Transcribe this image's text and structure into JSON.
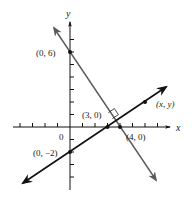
{
  "diagram": {
    "type": "coordinate-geometry",
    "axes": {
      "x_label": "x",
      "y_label": "y",
      "origin_label": "0",
      "unit_px": 12.5,
      "origin_px": [
        70,
        127
      ]
    },
    "lines": [
      {
        "name": "line-through-0-6-and-4-0",
        "color": "#5a5a5a",
        "points": [
          [
            0,
            6
          ],
          [
            4,
            0
          ]
        ],
        "slope": -1.5
      },
      {
        "name": "line-through-0-neg2-and-3-0",
        "color": "#111111",
        "points": [
          [
            0,
            -2
          ],
          [
            3,
            0
          ]
        ],
        "slope": 0.6667
      }
    ],
    "points": [
      {
        "label": "(0, 6)",
        "x": 0,
        "y": 6
      },
      {
        "label": "(3, 0)",
        "x": 3,
        "y": 0
      },
      {
        "label": "(4, 0)",
        "x": 4,
        "y": 0
      },
      {
        "label": "(0, −2)",
        "x": 0,
        "y": -2
      },
      {
        "label": "(x, y)",
        "x": 6,
        "y": 2
      }
    ],
    "annotations": {
      "right_angle_marker": true
    }
  }
}
